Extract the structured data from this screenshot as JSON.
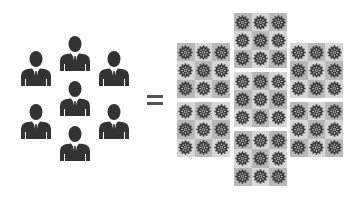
{
  "left_group": {
    "icon": "businessman-icon",
    "count": 7,
    "color": "#333333",
    "people": [
      {
        "x": 18,
        "y": 50
      },
      {
        "x": 57,
        "y": 35
      },
      {
        "x": 96,
        "y": 50
      },
      {
        "x": 57,
        "y": 80
      },
      {
        "x": 18,
        "y": 103
      },
      {
        "x": 96,
        "y": 103
      },
      {
        "x": 57,
        "y": 125
      }
    ]
  },
  "operator": {
    "symbol": "equals",
    "color": "#555555"
  },
  "right_group": {
    "icon": "gear-icon",
    "blocks_count": 7,
    "cells_per_block": 9,
    "blocks": [
      {
        "x": 177,
        "y": 43
      },
      {
        "x": 177,
        "y": 102
      },
      {
        "x": 234,
        "y": 13
      },
      {
        "x": 234,
        "y": 72
      },
      {
        "x": 234,
        "y": 131
      },
      {
        "x": 290,
        "y": 43
      },
      {
        "x": 290,
        "y": 102
      }
    ],
    "colors": {
      "cell_dark": "#b8b8b8",
      "cell_light": "#d6d6d6",
      "gear": "#3a3a3a"
    }
  }
}
